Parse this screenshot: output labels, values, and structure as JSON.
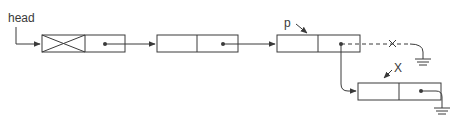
{
  "diagram": {
    "type": "linked-list-insertion",
    "labels": {
      "head": "head",
      "p": "p",
      "x": "X"
    },
    "nodes": [
      {
        "id": "node-header",
        "data": "",
        "is_header": true,
        "next": "node-2"
      },
      {
        "id": "node-2",
        "data": "",
        "next": "node-3"
      },
      {
        "id": "node-3",
        "data": "",
        "pointed_by": "p",
        "next": "node-4",
        "old_next": "null (removed)"
      },
      {
        "id": "node-4",
        "data": "",
        "pointed_by": "X",
        "next": "null"
      }
    ],
    "edges": [
      {
        "from": "head",
        "to": "node-header",
        "style": "solid"
      },
      {
        "from": "node-header",
        "to": "node-2",
        "style": "solid"
      },
      {
        "from": "node-2",
        "to": "node-3",
        "style": "solid"
      },
      {
        "from": "node-3",
        "to": "null",
        "style": "dashed",
        "crossed_out": true
      },
      {
        "from": "node-3",
        "to": "node-4",
        "style": "solid"
      },
      {
        "from": "node-4",
        "to": "null",
        "style": "solid"
      }
    ],
    "colors": {
      "stroke": "#3a3a3a",
      "background": "#ffffff"
    }
  }
}
